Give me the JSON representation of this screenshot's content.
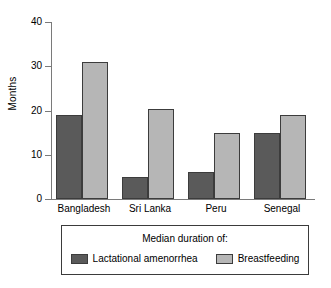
{
  "chart_data": {
    "type": "bar",
    "title": "",
    "subtitle": "",
    "xlabel": "",
    "ylabel": "Months",
    "ylim": [
      0,
      40
    ],
    "yticks": [
      0,
      10,
      20,
      30,
      40
    ],
    "grid": false,
    "legend_position": "bottom",
    "legend_title": "Median duration of:",
    "categories": [
      "Bangladesh",
      "Sri Lanka",
      "Peru",
      "Senegal"
    ],
    "series": [
      {
        "name": "Lactational amenorrhea",
        "color": "#5a5a5a",
        "values": [
          19,
          5,
          6,
          15
        ]
      },
      {
        "name": "Breastfeeding",
        "color": "#b6b6b6",
        "values": [
          31,
          20.3,
          15,
          19
        ]
      }
    ]
  }
}
